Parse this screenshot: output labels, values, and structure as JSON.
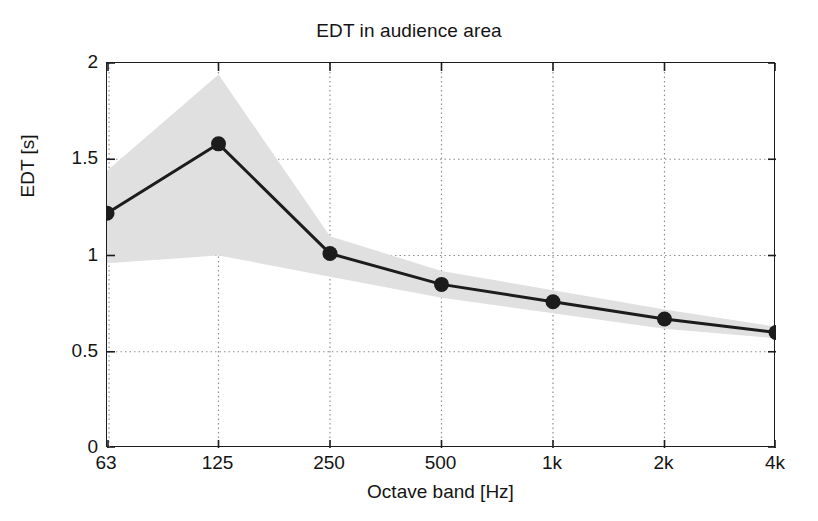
{
  "chart_data": {
    "type": "line",
    "title": "EDT in audience area",
    "xlabel": "Octave band [Hz]",
    "ylabel": "EDT [s]",
    "categories": [
      "63",
      "125",
      "250",
      "500",
      "1k",
      "2k",
      "4k"
    ],
    "values": [
      1.22,
      1.58,
      1.01,
      0.85,
      0.76,
      0.67,
      0.6
    ],
    "band_upper": [
      1.44,
      1.94,
      1.1,
      0.92,
      0.82,
      0.72,
      0.63
    ],
    "band_lower": [
      0.96,
      1.0,
      0.89,
      0.78,
      0.7,
      0.62,
      0.57
    ],
    "band_fill_color": "#e0e0e0",
    "line_color": "#1c1c1c",
    "marker_color": "#1c1c1c",
    "ylim": [
      0,
      2
    ],
    "yticks": [
      "0",
      "0.5",
      "1",
      "1.5",
      "2"
    ],
    "ytick_values": [
      0,
      0.5,
      1,
      1.5,
      2
    ],
    "grid": true,
    "grid_style": "dotted",
    "legend": null,
    "series_name": "EDT"
  },
  "figure": {
    "background": "#ffffff",
    "axis_color": "#1c1c1c"
  }
}
